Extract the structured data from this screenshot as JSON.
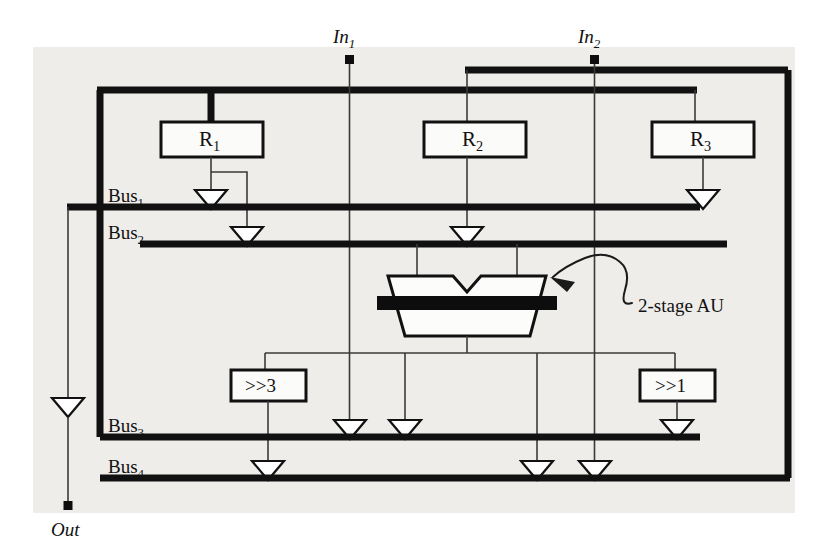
{
  "figure": {
    "kind": "datapath-block-diagram",
    "background_color": "#ffffff",
    "panel_color": "#eeedea",
    "line_color": "#111111"
  },
  "ports": {
    "in1": {
      "label": "In",
      "sub": "1"
    },
    "in2": {
      "label": "In",
      "sub": "2"
    },
    "out": {
      "label": "Out",
      "sub": ""
    }
  },
  "buses": [
    {
      "name": "bus1",
      "label": "Bus",
      "sub": "1"
    },
    {
      "name": "bus2",
      "label": "Bus",
      "sub": "2"
    },
    {
      "name": "bus3",
      "label": "Bus",
      "sub": "3"
    },
    {
      "name": "bus4",
      "label": "Bus",
      "sub": "4"
    }
  ],
  "registers": [
    {
      "name": "r1",
      "label": "R",
      "sub": "1"
    },
    {
      "name": "r2",
      "label": "R",
      "sub": "2"
    },
    {
      "name": "r3",
      "label": "R",
      "sub": "3"
    }
  ],
  "shifters": [
    {
      "name": "shift3",
      "label": ">>3"
    },
    {
      "name": "shift1",
      "label": ">>1"
    }
  ],
  "au": {
    "annotation": "2-stage AU",
    "bar_color": "#0d0d0d"
  }
}
